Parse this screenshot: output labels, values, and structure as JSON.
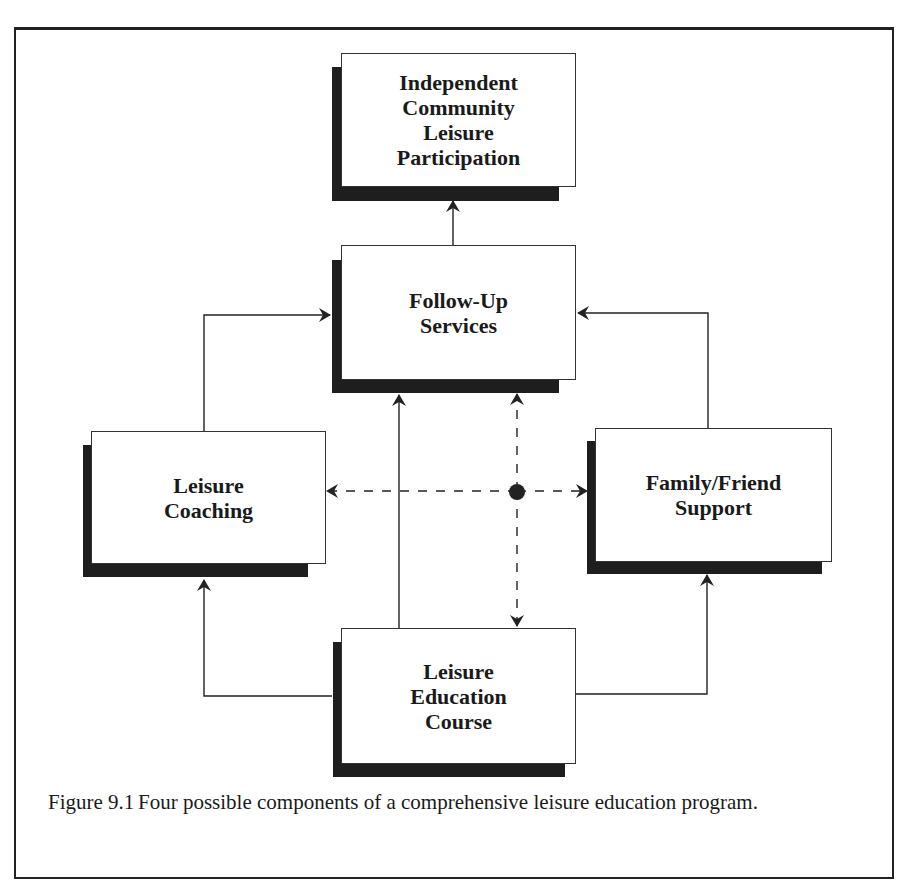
{
  "figure": {
    "boxes": {
      "top": {
        "label": "Independent\nCommunity\nLeisure\nParticipation"
      },
      "center": {
        "label": "Follow-Up\nServices"
      },
      "left": {
        "label": "Leisure\nCoaching"
      },
      "right": {
        "label": "Family/Friend\nSupport"
      },
      "bottom": {
        "label": "Leisure\nEducation\nCourse"
      }
    },
    "caption": {
      "number": "Figure 9.1",
      "text": "Four possible components of a comprehensive leisure education program."
    },
    "colors": {
      "line": "#222222",
      "shadow": "#1e1e1e",
      "box_fill": "#ffffff"
    }
  }
}
